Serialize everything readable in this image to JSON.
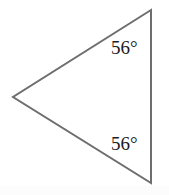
{
  "figure": {
    "type": "geometry-diagram",
    "shape_name": "isosceles-triangle",
    "background_color": "#ffffff",
    "stroke_color": "#6e6e6e",
    "stroke_width": 2,
    "text_color": "#1b1b1b",
    "canvas": {
      "width": 169,
      "height": 195
    },
    "vertices": [
      {
        "name": "top-vertex",
        "x": 151,
        "y": 10
      },
      {
        "name": "left-vertex",
        "x": 13,
        "y": 97
      },
      {
        "name": "bottom-vertex",
        "x": 151,
        "y": 183
      }
    ],
    "edges": [
      {
        "name": "upper-edge",
        "from": "top-vertex",
        "to": "left-vertex"
      },
      {
        "name": "lower-edge",
        "from": "left-vertex",
        "to": "bottom-vertex"
      },
      {
        "name": "right-edge",
        "from": "bottom-vertex",
        "to": "top-vertex"
      }
    ],
    "angle_labels": [
      {
        "name": "top-angle",
        "text": "56°",
        "value": 56,
        "unit": "degrees",
        "at_vertex": "top-vertex"
      },
      {
        "name": "bottom-angle",
        "text": "56°",
        "value": 56,
        "unit": "degrees",
        "at_vertex": "bottom-vertex"
      }
    ]
  }
}
